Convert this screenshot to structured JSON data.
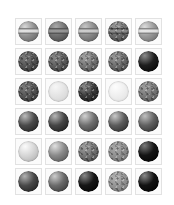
{
  "page": {
    "background_color": "#ffffff",
    "width": 174,
    "height": 205
  },
  "grid": {
    "columns": 5,
    "rows": 6,
    "cell_size": 30,
    "tile_size": 27,
    "sphere_size": 21,
    "tile_border_color": "#e2e2e2",
    "tile_background_color": "#fbfbfb",
    "origin_x": 13,
    "origin_y": 16
  },
  "cells": [
    {
      "id": "r1c1",
      "row": 1,
      "col": 1,
      "label": "Sphere 1",
      "style": "banded",
      "base_color": "#8f8f8f",
      "light_color": "#d8d8d8",
      "dark_color": "#5a5a5a",
      "band_color": "#e8e8e8",
      "highlight_x": 33,
      "highlight_y": 28,
      "speckle": false
    },
    {
      "id": "r1c2",
      "row": 1,
      "col": 2,
      "label": "Sphere 2",
      "style": "banded",
      "base_color": "#707070",
      "light_color": "#a8a8a8",
      "dark_color": "#3d3d3d",
      "band_color": "#9a9a9a",
      "highlight_x": 38,
      "highlight_y": 26,
      "speckle": false
    },
    {
      "id": "r1c3",
      "row": 1,
      "col": 3,
      "label": "Sphere 3",
      "style": "banded",
      "base_color": "#8a8a8a",
      "light_color": "#c6c6c6",
      "dark_color": "#555555",
      "band_color": "#d2d2d2",
      "highlight_x": 34,
      "highlight_y": 27,
      "speckle": false
    },
    {
      "id": "r1c4",
      "row": 1,
      "col": 4,
      "label": "Sphere 4",
      "style": "banded",
      "base_color": "#6e6e6e",
      "light_color": "#9e9e9e",
      "dark_color": "#3a3a3a",
      "band_color": "#8c8c8c",
      "highlight_x": 40,
      "highlight_y": 24,
      "speckle": true
    },
    {
      "id": "r1c5",
      "row": 1,
      "col": 5,
      "label": "Sphere 5",
      "style": "banded",
      "base_color": "#9a9a9a",
      "light_color": "#dcdcdc",
      "dark_color": "#626262",
      "band_color": "#ececec",
      "highlight_x": 32,
      "highlight_y": 28,
      "speckle": false
    },
    {
      "id": "r2c1",
      "row": 2,
      "col": 1,
      "label": "Sphere 6",
      "style": "matte",
      "base_color": "#555555",
      "light_color": "#7c7c7c",
      "dark_color": "#262626",
      "band_color": "#6a6a6a",
      "highlight_x": 36,
      "highlight_y": 30,
      "speckle": true
    },
    {
      "id": "r2c2",
      "row": 2,
      "col": 2,
      "label": "Sphere 7",
      "style": "matte",
      "base_color": "#5e5e5e",
      "light_color": "#8a8a8a",
      "dark_color": "#2c2c2c",
      "band_color": "#757575",
      "highlight_x": 36,
      "highlight_y": 30,
      "speckle": true
    },
    {
      "id": "r2c3",
      "row": 2,
      "col": 3,
      "label": "Sphere 8",
      "style": "matte",
      "base_color": "#767676",
      "light_color": "#a5a5a5",
      "dark_color": "#3e3e3e",
      "band_color": "#8e8e8e",
      "highlight_x": 36,
      "highlight_y": 28,
      "speckle": true
    },
    {
      "id": "r2c4",
      "row": 2,
      "col": 4,
      "label": "Sphere 9",
      "style": "matte",
      "base_color": "#6c6c6c",
      "light_color": "#9c9c9c",
      "dark_color": "#343434",
      "band_color": "#858585",
      "highlight_x": 36,
      "highlight_y": 30,
      "speckle": true
    },
    {
      "id": "r2c5",
      "row": 2,
      "col": 5,
      "label": "Sphere 10",
      "style": "glossy",
      "base_color": "#1e1e1e",
      "light_color": "#8c8c8c",
      "dark_color": "#000000",
      "band_color": "#3a3a3a",
      "highlight_x": 32,
      "highlight_y": 22,
      "speckle": false
    },
    {
      "id": "r3c1",
      "row": 3,
      "col": 1,
      "label": "Sphere 11",
      "style": "matte",
      "base_color": "#555555",
      "light_color": "#7e7e7e",
      "dark_color": "#272727",
      "band_color": "#6a6a6a",
      "highlight_x": 36,
      "highlight_y": 30,
      "speckle": true
    },
    {
      "id": "r3c2",
      "row": 3,
      "col": 2,
      "label": "Sphere 12",
      "style": "pale",
      "base_color": "#e4e4e4",
      "light_color": "#f6f6f6",
      "dark_color": "#cfcfcf",
      "band_color": "#eeeeee",
      "highlight_x": 36,
      "highlight_y": 28,
      "speckle": false
    },
    {
      "id": "r3c3",
      "row": 3,
      "col": 3,
      "label": "Sphere 13",
      "style": "glossy",
      "base_color": "#3a3a3a",
      "light_color": "#8f8f8f",
      "dark_color": "#121212",
      "band_color": "#4e4e4e",
      "highlight_x": 34,
      "highlight_y": 26,
      "speckle": true
    },
    {
      "id": "r3c4",
      "row": 3,
      "col": 4,
      "label": "Sphere 14",
      "style": "pale",
      "base_color": "#efefef",
      "light_color": "#fdfdfd",
      "dark_color": "#dedede",
      "band_color": "#f6f6f6",
      "highlight_x": 36,
      "highlight_y": 28,
      "speckle": false
    },
    {
      "id": "r3c5",
      "row": 3,
      "col": 5,
      "label": "Sphere 15",
      "style": "matte",
      "base_color": "#787878",
      "light_color": "#a0a0a0",
      "dark_color": "#484848",
      "band_color": "#8a8a8a",
      "highlight_x": 36,
      "highlight_y": 30,
      "speckle": true
    },
    {
      "id": "r4c1",
      "row": 4,
      "col": 1,
      "label": "Sphere 16",
      "style": "glossy",
      "base_color": "#4a4a4a",
      "light_color": "#bcbcbc",
      "dark_color": "#1a1a1a",
      "band_color": "#5e5e5e",
      "highlight_x": 33,
      "highlight_y": 24,
      "speckle": false
    },
    {
      "id": "r4c2",
      "row": 4,
      "col": 2,
      "label": "Sphere 17",
      "style": "glossy",
      "base_color": "#454545",
      "light_color": "#b6b6b6",
      "dark_color": "#161616",
      "band_color": "#585858",
      "highlight_x": 33,
      "highlight_y": 24,
      "speckle": false
    },
    {
      "id": "r4c3",
      "row": 4,
      "col": 3,
      "label": "Sphere 18",
      "style": "glossy",
      "base_color": "#6e6e6e",
      "light_color": "#d2d2d2",
      "dark_color": "#333333",
      "band_color": "#848484",
      "highlight_x": 33,
      "highlight_y": 24,
      "speckle": false
    },
    {
      "id": "r4c4",
      "row": 4,
      "col": 4,
      "label": "Sphere 19",
      "style": "glossy",
      "base_color": "#5c5c5c",
      "light_color": "#cacaca",
      "dark_color": "#222222",
      "band_color": "#707070",
      "highlight_x": 33,
      "highlight_y": 24,
      "speckle": false
    },
    {
      "id": "r4c5",
      "row": 4,
      "col": 5,
      "label": "Sphere 20",
      "style": "glossy",
      "base_color": "#606060",
      "light_color": "#c0c0c0",
      "dark_color": "#242424",
      "band_color": "#747474",
      "highlight_x": 33,
      "highlight_y": 24,
      "speckle": false
    },
    {
      "id": "r5c1",
      "row": 5,
      "col": 1,
      "label": "Sphere 21",
      "style": "pale",
      "base_color": "#d6d6d6",
      "light_color": "#fbfbfb",
      "dark_color": "#a8a8a8",
      "band_color": "#e8e8e8",
      "highlight_x": 34,
      "highlight_y": 26,
      "speckle": false
    },
    {
      "id": "r5c2",
      "row": 5,
      "col": 2,
      "label": "Sphere 22",
      "style": "glossy",
      "base_color": "#8a8a8a",
      "light_color": "#e0e0e0",
      "dark_color": "#4a4a4a",
      "band_color": "#9e9e9e",
      "highlight_x": 33,
      "highlight_y": 24,
      "speckle": false
    },
    {
      "id": "r5c3",
      "row": 5,
      "col": 3,
      "label": "Sphere 23",
      "style": "matte",
      "base_color": "#747474",
      "light_color": "#a2a2a2",
      "dark_color": "#3c3c3c",
      "band_color": "#868686",
      "highlight_x": 36,
      "highlight_y": 28,
      "speckle": true
    },
    {
      "id": "r5c4",
      "row": 5,
      "col": 4,
      "label": "Sphere 24",
      "style": "matte",
      "base_color": "#8e8e8e",
      "light_color": "#ababab",
      "dark_color": "#666666",
      "band_color": "#989898",
      "highlight_x": 38,
      "highlight_y": 34,
      "speckle": true
    },
    {
      "id": "r5c5",
      "row": 5,
      "col": 5,
      "label": "Sphere 25",
      "style": "glossy",
      "base_color": "#141414",
      "light_color": "#7a7a7a",
      "dark_color": "#000000",
      "band_color": "#2e2e2e",
      "highlight_x": 31,
      "highlight_y": 22,
      "speckle": false
    },
    {
      "id": "r6c1",
      "row": 6,
      "col": 1,
      "label": "Sphere 26",
      "style": "glossy",
      "base_color": "#484848",
      "light_color": "#b2b2b2",
      "dark_color": "#181818",
      "band_color": "#5c5c5c",
      "highlight_x": 32,
      "highlight_y": 25,
      "speckle": false
    },
    {
      "id": "r6c2",
      "row": 6,
      "col": 2,
      "label": "Sphere 27",
      "style": "glossy",
      "base_color": "#6a6a6a",
      "light_color": "#cdcdcd",
      "dark_color": "#2e2e2e",
      "band_color": "#808080",
      "highlight_x": 32,
      "highlight_y": 25,
      "speckle": false
    },
    {
      "id": "r6c3",
      "row": 6,
      "col": 3,
      "label": "Sphere 28",
      "style": "glossy",
      "base_color": "#161616",
      "light_color": "#888888",
      "dark_color": "#000000",
      "band_color": "#303030",
      "highlight_x": 31,
      "highlight_y": 22,
      "speckle": false
    },
    {
      "id": "r6c4",
      "row": 6,
      "col": 4,
      "label": "Sphere 29",
      "style": "matte",
      "base_color": "#939393",
      "light_color": "#b4b4b4",
      "dark_color": "#6c6c6c",
      "band_color": "#9e9e9e",
      "highlight_x": 38,
      "highlight_y": 32,
      "speckle": true
    },
    {
      "id": "r6c5",
      "row": 6,
      "col": 5,
      "label": "Sphere 30",
      "style": "glossy",
      "base_color": "#121212",
      "light_color": "#8a8a8a",
      "dark_color": "#000000",
      "band_color": "#2c2c2c",
      "highlight_x": 31,
      "highlight_y": 22,
      "speckle": false
    }
  ]
}
